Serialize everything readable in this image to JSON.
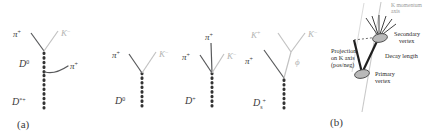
{
  "figure": {
    "panels": [
      {
        "id": "panel-a",
        "caption": "(a)",
        "decays": [
          {
            "id": "decay-dstar",
            "mother_label": "D",
            "mother_sup": "*+",
            "mother_sub": "",
            "intermediate_label": "D",
            "intermediate_sup": "0",
            "daughters": [
              {
                "name": "pi-plus-left",
                "label": "π",
                "sup": "+",
                "tone": "dark"
              },
              {
                "name": "k-minus-right",
                "label": "K",
                "sup": "−",
                "tone": "gray"
              },
              {
                "name": "pi-plus-soft",
                "label": "π",
                "sup": "+",
                "tone": "dark"
              }
            ]
          },
          {
            "id": "decay-d0",
            "mother_label": "D",
            "mother_sup": "0",
            "mother_sub": "",
            "daughters": [
              {
                "name": "pi-plus-left",
                "label": "π",
                "sup": "+",
                "tone": "dark"
              },
              {
                "name": "k-minus-right",
                "label": "K",
                "sup": "−",
                "tone": "gray"
              }
            ]
          },
          {
            "id": "decay-dplus",
            "mother_label": "D",
            "mother_sup": "+",
            "mother_sub": "",
            "daughters": [
              {
                "name": "pi-plus-left",
                "label": "π",
                "sup": "+",
                "tone": "dark"
              },
              {
                "name": "pi-plus-top",
                "label": "π",
                "sup": "+",
                "tone": "dark"
              },
              {
                "name": "k-minus-right",
                "label": "K",
                "sup": "−",
                "tone": "gray"
              }
            ]
          },
          {
            "id": "decay-ds",
            "mother_label": "D",
            "mother_sup": "+",
            "mother_sub": "s",
            "resonance_label": "ϕ",
            "daughters": [
              {
                "name": "pi-plus-left",
                "label": "π",
                "sup": "+",
                "tone": "dark"
              },
              {
                "name": "k-plus-left",
                "label": "K",
                "sup": "+",
                "tone": "gray"
              },
              {
                "name": "k-minus-right",
                "label": "K",
                "sup": "−",
                "tone": "gray"
              }
            ]
          }
        ]
      },
      {
        "id": "panel-b",
        "caption": "(b)",
        "axis_label_line1": "K momentum",
        "axis_label_line2": "axis",
        "annotations": {
          "projection_line1": "Projection",
          "projection_line2": "on K axis",
          "projection_line3": "(pos/neg)",
          "secondary_line1": "Secondary",
          "secondary_line2": "vertex",
          "decay_length": "Decay length",
          "primary_line1": "Primary",
          "primary_line2": "vertex"
        }
      }
    ]
  },
  "colors": {
    "track_dark": "#58595b",
    "track_gray": "#c2c2c2",
    "vertex_dotted": "#333333",
    "vertex_fill": "#b9b9b9",
    "vertex_stroke": "#4a4a4a",
    "axis_gray": "#c9c9c9",
    "background": "#ffffff"
  }
}
